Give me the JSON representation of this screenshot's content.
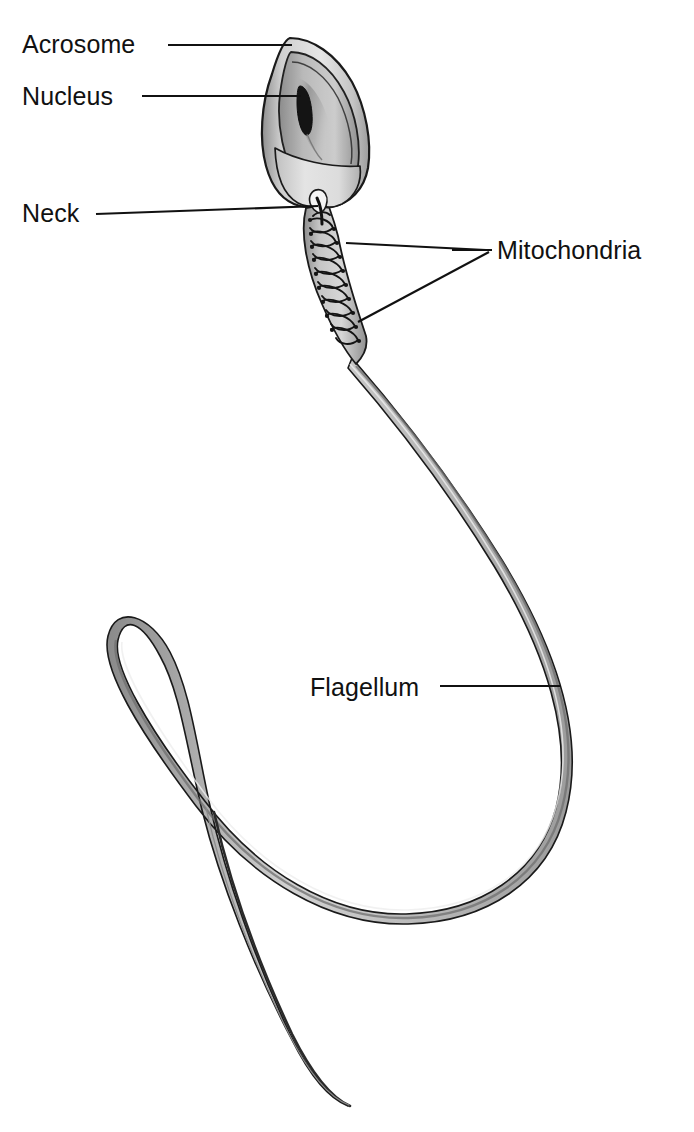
{
  "figure": {
    "style": "black-and-white line drawing with gray shading",
    "background_color": "#ffffff",
    "ink_color": "#111111"
  },
  "labels": [
    {
      "id": "acrosome",
      "text": "Acrosome",
      "text_x": 22,
      "text_y": 53,
      "leader": "M 168 45 L 292 45",
      "points_to": "tip of the sperm head cap"
    },
    {
      "id": "nucleus",
      "text": "Nucleus",
      "text_x": 22,
      "text_y": 105,
      "leader": "M 142 96 L 300 96",
      "points_to": "dark oval body inside the head"
    },
    {
      "id": "neck",
      "text": "Neck",
      "text_x": 22,
      "text_y": 222,
      "leader": "M 96 214 L 318 207",
      "points_to": "narrow junction between head and midpiece"
    },
    {
      "id": "mitochondria",
      "text": "Mitochondria",
      "text_x": 497,
      "text_y": 259,
      "leader_main": "M 486 250 L 492 250",
      "leader_branch_1": "M 486 250 L 348 244",
      "leader_branch_2": "M 489 251 L 360 322",
      "points_to": "helical coils wrapped around the midpiece"
    },
    {
      "id": "flagellum",
      "text": "Flagellum",
      "text_x": 310,
      "text_y": 696,
      "leader": "M 440 686 L 561 686",
      "points_to": "long whip-like tail"
    }
  ],
  "structures": [
    {
      "id": "head",
      "name": "Head"
    },
    {
      "id": "acrosome-cap",
      "name": "Acrosome cap"
    },
    {
      "id": "nucleus-body",
      "name": "Nucleus"
    },
    {
      "id": "neck-region",
      "name": "Neck"
    },
    {
      "id": "midpiece",
      "name": "Midpiece with mitochondria"
    },
    {
      "id": "tail",
      "name": "Flagellum"
    }
  ],
  "colors": {
    "outline": "#1a1a1a",
    "head_fill_light": "#e8e8e8",
    "head_fill_mid": "#c9c9c9",
    "head_shadow": "#9a9a9a",
    "nucleus_fill": "#141414",
    "tail_fill": "#b4b4b4",
    "tail_highlight": "#d8d8d8"
  }
}
